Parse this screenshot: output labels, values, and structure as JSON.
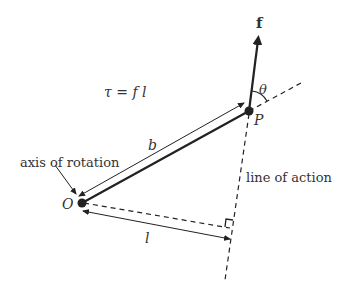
{
  "diagram": {
    "labels": {
      "force": "f",
      "angle": "θ",
      "point_p": "P",
      "point_o": "O",
      "equation": "τ = f l",
      "lever_b": "b",
      "lever_l": "l",
      "axis": "axis of rotation",
      "line_of_action": "line of action"
    },
    "colors": {
      "ink": "#222222",
      "text": "#333333",
      "background": "#ffffff"
    }
  }
}
